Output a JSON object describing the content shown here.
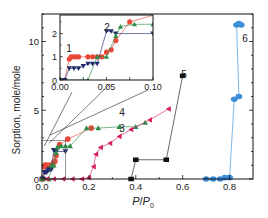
{
  "chart_data": {
    "type": "scatter",
    "title": "",
    "xlabel": "P/P0",
    "ylabel": "Sorption, mole/mole",
    "xlim": [
      0.0,
      0.9
    ],
    "ylim": [
      0,
      12
    ],
    "xticks": [
      "0.0",
      "0.2",
      "0.4",
      "0.6",
      "0.8"
    ],
    "yticks": [
      "0",
      "5",
      "10"
    ],
    "grid": false,
    "series": [
      {
        "name": "1",
        "color": "#e8483a",
        "marker": "circle",
        "line": true,
        "x": [
          0.0,
          0.005,
          0.01,
          0.012,
          0.015,
          0.018,
          0.02,
          0.03,
          0.035,
          0.04,
          0.045,
          0.05,
          0.055,
          0.06,
          0.075,
          0.11,
          0.21
        ],
        "y": [
          0.0,
          0.0,
          0.9,
          1.0,
          1.0,
          1.0,
          1.0,
          1.0,
          1.0,
          1.0,
          1.0,
          1.2,
          1.3,
          1.7,
          2.5,
          2.9,
          3.7
        ]
      },
      {
        "name": "2",
        "color": "#1f2a6b",
        "marker": "triangle-down",
        "line": true,
        "x": [
          0.0,
          0.005,
          0.01,
          0.015,
          0.02,
          0.025,
          0.03,
          0.035,
          0.04,
          0.05,
          0.055,
          0.06,
          0.1
        ],
        "y": [
          0.0,
          0.0,
          0.5,
          0.5,
          0.5,
          0.6,
          0.7,
          0.7,
          0.7,
          2.1,
          2.1,
          2.0,
          2.0
        ]
      },
      {
        "name": "3",
        "color": "#2e8b4a",
        "marker": "triangle-up",
        "line": true,
        "x": [
          0.0,
          0.03,
          0.04,
          0.05,
          0.06,
          0.065,
          0.08,
          0.1,
          0.12,
          0.19,
          0.24,
          0.33,
          0.4,
          0.44
        ],
        "y": [
          0.0,
          0.0,
          1.0,
          1.0,
          1.9,
          2.3,
          2.4,
          2.4,
          2.4,
          3.7,
          3.7,
          3.8,
          3.8,
          4.1
        ]
      },
      {
        "name": "4",
        "color": "#d6235e",
        "marker": "triangle-left",
        "line": true,
        "x": [
          0.02,
          0.05,
          0.09,
          0.13,
          0.17,
          0.2,
          0.22,
          0.23,
          0.25,
          0.29,
          0.33,
          0.38,
          0.46,
          0.54
        ],
        "y": [
          0.0,
          0.0,
          0.0,
          0.0,
          0.0,
          0.1,
          0.9,
          1.8,
          2.3,
          2.6,
          3.1,
          3.6,
          4.3,
          5.1
        ]
      },
      {
        "name": "5",
        "color": "#111111",
        "marker": "square",
        "line": true,
        "x": [
          0.38,
          0.4,
          0.53,
          0.6
        ],
        "y": [
          0.0,
          1.4,
          1.4,
          7.5
        ]
      },
      {
        "name": "6",
        "color": "#3b8fd9",
        "marker": "diamond",
        "line": true,
        "x": [
          0.7,
          0.73,
          0.76,
          0.78,
          0.8,
          0.82,
          0.84,
          0.83,
          0.84,
          0.85
        ],
        "y": [
          0.0,
          0.0,
          0.0,
          0.1,
          0.1,
          5.8,
          6.0,
          11.2,
          11.3,
          11.2
        ]
      }
    ],
    "annotations": [
      {
        "text": "1",
        "series": "1"
      },
      {
        "text": "2",
        "series": "2"
      },
      {
        "text": "3",
        "series": "3"
      },
      {
        "text": "4",
        "series": "4"
      },
      {
        "text": "5",
        "series": "5"
      },
      {
        "text": "6",
        "series": "6"
      }
    ],
    "inset": {
      "xlim": [
        0.0,
        0.1
      ],
      "ylim": [
        0,
        2.8
      ],
      "xticks": [
        "0.00",
        "0.05",
        "0.10"
      ],
      "yticks": [
        "0",
        "1",
        "2"
      ],
      "labels": [
        {
          "text": "1"
        },
        {
          "text": "2"
        }
      ]
    }
  }
}
